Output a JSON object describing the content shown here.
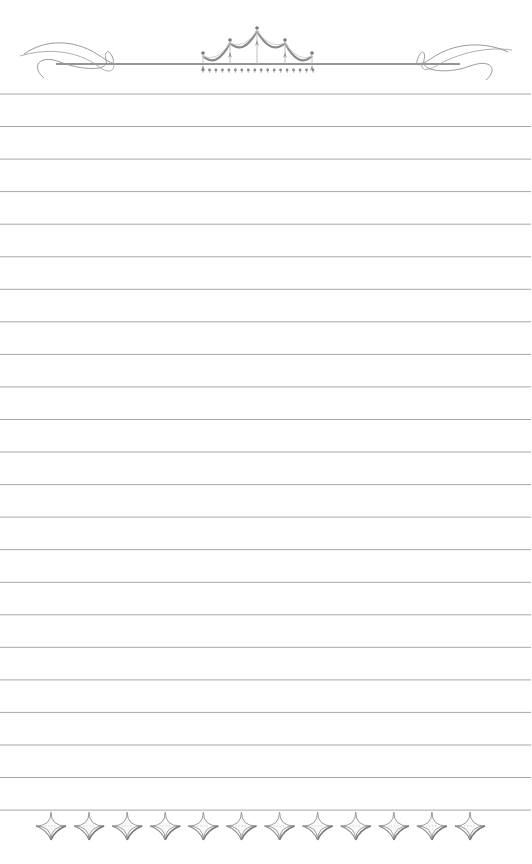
{
  "page": {
    "type": "lined-stationery",
    "width": 532,
    "height": 864,
    "background": "#ffffff"
  },
  "lines": {
    "count": 23,
    "first_y": 94,
    "spacing": 32.55,
    "x_start": 0,
    "x_end": 531,
    "color": "#a8a8a8"
  },
  "header_ornament": {
    "icon": "crown-swag-flourish-icon",
    "bar_y": 64,
    "bar_x_start": 56,
    "bar_x_end": 460,
    "bar_color": "#707070",
    "flourish_color": "#9a9a9a",
    "finials": [
      [
        203,
        53
      ],
      [
        230,
        40
      ],
      [
        257,
        28
      ],
      [
        285,
        40
      ],
      [
        312,
        53
      ]
    ],
    "beads": {
      "y": 70,
      "x_start": 203,
      "x_end": 313,
      "count": 18
    }
  },
  "footer_ornament": {
    "icon": "four-point-star-border-icon",
    "center_y": 826,
    "star_count": 12,
    "first_x": 51,
    "last_x": 470,
    "color": "#9a9a9a"
  }
}
